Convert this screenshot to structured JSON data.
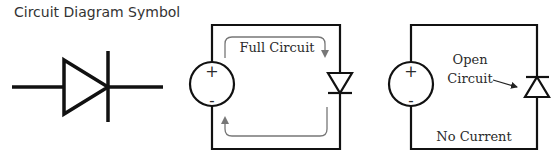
{
  "title": "Circuit Diagram Symbol",
  "panels": [
    {
      "id": "symbol",
      "label": "Diode symbol"
    },
    {
      "id": "forward",
      "label": "Full Circuit",
      "source": {
        "plus": "+",
        "minus": "-"
      }
    },
    {
      "id": "reverse",
      "label_line1": "Open",
      "label_line2": "Circuit",
      "bottom_label": "No Current",
      "source": {
        "plus": "+",
        "minus": "-"
      }
    }
  ],
  "colors": {
    "wire": "#111111",
    "flow_arrow": "#777777",
    "text": "#2b2b2b"
  }
}
